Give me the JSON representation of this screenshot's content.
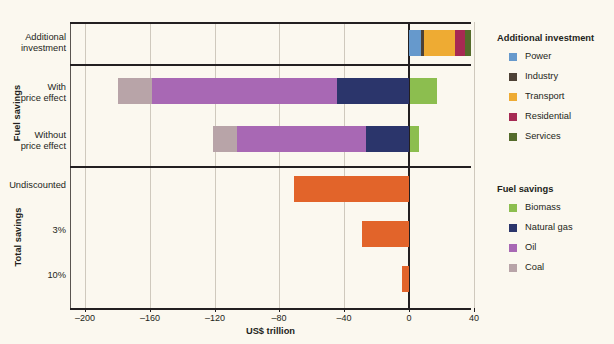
{
  "chart_data": {
    "type": "bar",
    "orientation": "horizontal",
    "stacked": true,
    "title": "",
    "xlabel": "US$ trillion",
    "ylabel": "",
    "xlim": [
      -220,
      40
    ],
    "xticks": [
      -200,
      -160,
      -120,
      -80,
      -40,
      0,
      40
    ],
    "xticklabels": [
      "–200",
      "–160",
      "–120",
      "–80",
      "–40",
      "0",
      "40"
    ],
    "grid": true,
    "legend_position": "right",
    "groups": [
      {
        "name": "Additional investment",
        "rows": [
          {
            "label": "Additional\ninvestment",
            "label_line1": "Additional",
            "label_line2": "investment",
            "segments": [
              {
                "name": "Power",
                "value": 7.4
              },
              {
                "name": "Industry",
                "value": 2.0
              },
              {
                "name": "Transport",
                "value": 19.0
              },
              {
                "name": "Residential",
                "value": 6.0
              },
              {
                "name": "Services",
                "value": 4.0
              }
            ]
          }
        ]
      },
      {
        "name": "Fuel savings",
        "rows": [
          {
            "label_line1": "With",
            "label_line2": "price effect",
            "segments": [
              {
                "name": "Coal",
                "value": -21.0
              },
              {
                "name": "Oil",
                "value": -115.0
              },
              {
                "name": "Natural gas",
                "value": -44.0
              },
              {
                "name": "Biomass",
                "value": 17.0
              }
            ],
            "negative_total": -180.0,
            "positive_total": 17.0
          },
          {
            "label_line1": "Without",
            "label_line2": "price effect",
            "segments": [
              {
                "name": "Coal",
                "value": -15.0
              },
              {
                "name": "Oil",
                "value": -80.0
              },
              {
                "name": "Natural gas",
                "value": -26.0
              },
              {
                "name": "Biomass",
                "value": 6.0
              }
            ],
            "negative_total": -121.0,
            "positive_total": 6.0
          }
        ]
      },
      {
        "name": "Total savings",
        "rows": [
          {
            "label_line1": "Undiscounted",
            "label_line2": "",
            "segments": [
              {
                "name": "Total",
                "value": -71.0
              }
            ]
          },
          {
            "label_line1": "3%",
            "label_line2": "",
            "segments": [
              {
                "name": "Total",
                "value": -29.0
              }
            ]
          },
          {
            "label_line1": "10%",
            "label_line2": "",
            "segments": [
              {
                "name": "Total",
                "value": -4.0
              }
            ]
          }
        ]
      }
    ],
    "series_colors": {
      "Power": "#6699cc",
      "Industry": "#4d4136",
      "Transport": "#eeab33",
      "Residential": "#a62a53",
      "Services": "#546b2b",
      "Biomass": "#8cbe4f",
      "Natural gas": "#2b356b",
      "Oil": "#a868b4",
      "Coal": "#b8a4a8",
      "Total": "#e2642a"
    }
  },
  "legends": [
    {
      "title": "Additional investment",
      "items": [
        {
          "label": "Power",
          "color": "#6699cc"
        },
        {
          "label": "Industry",
          "color": "#4d4136"
        },
        {
          "label": "Transport",
          "color": "#eeab33"
        },
        {
          "label": "Residential",
          "color": "#a62a53"
        },
        {
          "label": "Services",
          "color": "#546b2b"
        }
      ]
    },
    {
      "title": "Fuel savings",
      "items": [
        {
          "label": "Biomass",
          "color": "#8cbe4f"
        },
        {
          "label": "Natural gas",
          "color": "#2b356b"
        },
        {
          "label": "Oil",
          "color": "#a868b4"
        },
        {
          "label": "Coal",
          "color": "#b8a4a8"
        }
      ]
    }
  ],
  "row_labels": {
    "additional_investment_l1": "Additional",
    "additional_investment_l2": "investment",
    "with_price_effect_l1": "With",
    "with_price_effect_l2": "price effect",
    "without_price_effect_l1": "Without",
    "without_price_effect_l2": "price effect",
    "undiscounted": "Undiscounted",
    "rate_3": "3%",
    "rate_10": "10%"
  },
  "group_labels": {
    "fuel_savings": "Fuel savings",
    "total_savings": "Total savings"
  },
  "axis": {
    "xtitle": "US$ trillion",
    "ticks": [
      "–200",
      "–160",
      "–120",
      "–80",
      "–40",
      "0",
      "40"
    ]
  }
}
